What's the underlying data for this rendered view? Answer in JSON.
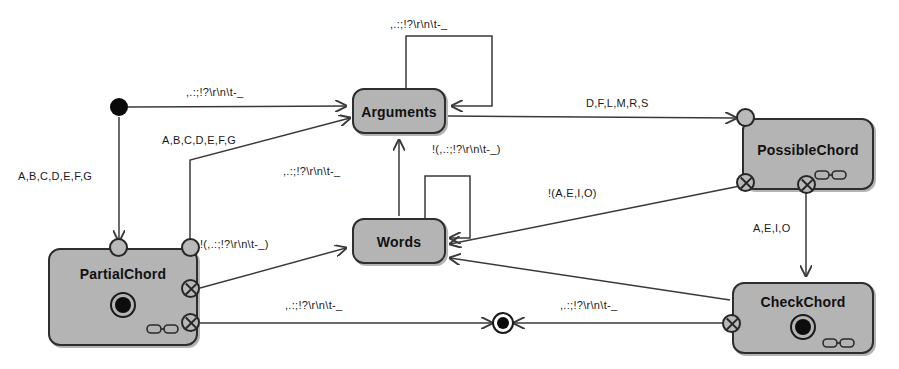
{
  "diagram": {
    "background": "#ffffff",
    "node_fill": "#b4b4b4",
    "node_stroke": "#2e2e2e",
    "edge_color": "#3a3a3a",
    "text_color": "#111111"
  },
  "symbols": {
    "punctuation_class": ",.:;!?\\r\\n\\t-_",
    "not_punctuation_class": "!(,.:;!?\\r\\n\\t-_)",
    "chord_letters": "A,B,C,D,E,F,G",
    "consonant_letters": "D,F,L,M,R,S",
    "vowel_letters": "A,E,I,O",
    "not_vowel_letters": "!(A,E,I,O)"
  },
  "states": [
    {
      "id": "arguments",
      "label": "Arguments",
      "x": 352,
      "y": 88,
      "w": 94,
      "h": 46,
      "final": false,
      "chain": false
    },
    {
      "id": "words",
      "label": "Words",
      "x": 352,
      "y": 218,
      "w": 94,
      "h": 46,
      "final": false,
      "chain": false
    },
    {
      "id": "partial_chord",
      "label": "PartialChord",
      "x": 48,
      "y": 248,
      "w": 150,
      "h": 98,
      "final": true,
      "chain": true
    },
    {
      "id": "possible_chord",
      "label": "PossibleChord",
      "x": 742,
      "y": 118,
      "w": 132,
      "h": 72,
      "final": false,
      "chain": true
    },
    {
      "id": "check_chord",
      "label": "CheckChord",
      "x": 732,
      "y": 282,
      "w": 142,
      "h": 72,
      "final": true,
      "chain": true
    }
  ],
  "markers": {
    "start_state": {
      "name": "initial-state",
      "x": 119,
      "y": 107,
      "r": 9
    },
    "final_state_inline": {
      "name": "final-state-marker",
      "x": 503,
      "y": 323,
      "r_outer": 11,
      "r_inner": 6
    }
  },
  "ports": [
    {
      "id": "possible-in-top",
      "kind": "circle",
      "x": 745,
      "y": 117
    },
    {
      "id": "possible-out-left",
      "kind": "x",
      "x": 745,
      "y": 182
    },
    {
      "id": "possible-out-bottom",
      "kind": "x",
      "x": 806,
      "y": 184
    },
    {
      "id": "partial-in-top",
      "kind": "circle",
      "x": 118,
      "y": 247
    },
    {
      "id": "partial-in-right-top",
      "kind": "circle",
      "x": 190,
      "y": 247
    },
    {
      "id": "partial-out-mid",
      "kind": "x",
      "x": 190,
      "y": 288
    },
    {
      "id": "partial-out-low",
      "kind": "x",
      "x": 190,
      "y": 322
    },
    {
      "id": "check-out-left",
      "kind": "x",
      "x": 731,
      "y": 323
    }
  ],
  "transitions": [
    {
      "id": "start-to-arguments",
      "from": "initial-state",
      "to": "arguments",
      "label": ",.:;!?\\r\\n\\t-_",
      "lx": 186,
      "ly": 86
    },
    {
      "id": "start-to-partialchord",
      "from": "initial-state",
      "to": "partial-chord",
      "label": "A,B,C,D,E,F,G",
      "lx": 18,
      "ly": 170
    },
    {
      "id": "arguments-self-loop",
      "from": "arguments",
      "to": "arguments",
      "label": ",.:;!?\\r\\n\\t-_",
      "lx": 390,
      "ly": 18
    },
    {
      "id": "arguments-to-possible",
      "from": "arguments",
      "to": "possible-chord",
      "label": "D,F,L,M,R,S",
      "lx": 586,
      "ly": 97
    },
    {
      "id": "partial-to-arguments",
      "from": "partial-chord",
      "to": "arguments",
      "label": "A,B,C,D,E,F,G",
      "lx": 162,
      "ly": 134
    },
    {
      "id": "words-to-arguments",
      "from": "words",
      "to": "arguments",
      "label": ",.:;!?\\r\\n\\t-_",
      "lx": 283,
      "ly": 165
    },
    {
      "id": "words-self-loop",
      "from": "words",
      "to": "words",
      "label": "!(,.:;!?\\r\\n\\t-_)",
      "lx": 432,
      "ly": 143
    },
    {
      "id": "partial-to-words",
      "from": "partial-chord",
      "to": "words",
      "label": "!(,.:;!?\\r\\n\\t-_)",
      "lx": 200,
      "ly": 238
    },
    {
      "id": "possible-to-words",
      "from": "possible-chord",
      "to": "words",
      "label": "!(A,E,I,O)",
      "lx": 548,
      "ly": 187
    },
    {
      "id": "possible-to-check",
      "from": "possible-chord",
      "to": "check-chord",
      "label": "A,E,I,O",
      "lx": 753,
      "ly": 222
    },
    {
      "id": "partial-to-final",
      "from": "partial-chord",
      "to": "final-state",
      "label": ",.:;!?\\r\\n\\t-_",
      "lx": 285,
      "ly": 299
    },
    {
      "id": "check-to-final",
      "from": "check-chord",
      "to": "final-state",
      "label": ",.:;!?\\r\\n\\t-_",
      "lx": 560,
      "ly": 299
    },
    {
      "id": "check-to-words",
      "from": "check-chord",
      "to": "words",
      "label": "",
      "lx": 0,
      "ly": 0
    }
  ]
}
